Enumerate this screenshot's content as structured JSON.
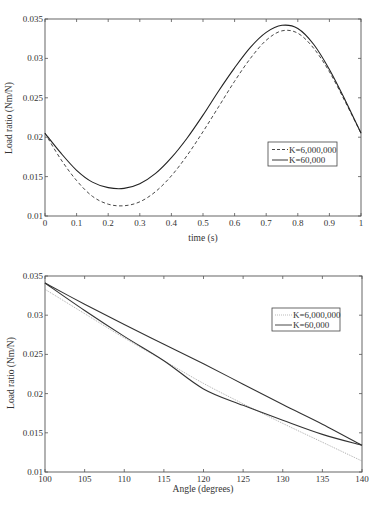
{
  "chart_data": [
    {
      "type": "line",
      "title": "",
      "xlabel": "time (s)",
      "ylabel": "Load ratio (Nm/N)",
      "xlim": [
        0,
        1
      ],
      "ylim": [
        0.01,
        0.035
      ],
      "grid": false,
      "legend_position": "inside right, lower-middle",
      "x_ticks": [
        "0",
        "0.1",
        "0.2",
        "0.3",
        "0.4",
        "0.5",
        "0.6",
        "0.7",
        "0.8",
        "0.9",
        "1"
      ],
      "y_ticks": [
        "0.01",
        "0.015",
        "0.02",
        "0.025",
        "0.03",
        "0.035"
      ],
      "x": [
        0,
        0.05,
        0.1,
        0.15,
        0.2,
        0.25,
        0.3,
        0.35,
        0.4,
        0.45,
        0.5,
        0.55,
        0.6,
        0.65,
        0.7,
        0.75,
        0.8,
        0.85,
        0.9,
        0.95,
        1.0
      ],
      "series": [
        {
          "name": "K=6,000,000",
          "style": "dashed",
          "color": "#333333",
          "values": [
            0.0205,
            0.0172,
            0.0145,
            0.0125,
            0.0115,
            0.0113,
            0.0118,
            0.0131,
            0.0151,
            0.0177,
            0.0207,
            0.0239,
            0.0271,
            0.03,
            0.0323,
            0.0335,
            0.0332,
            0.0313,
            0.0283,
            0.0245,
            0.0205
          ]
        },
        {
          "name": "K=60,000",
          "style": "solid",
          "color": "#222222",
          "values": [
            0.0205,
            0.018,
            0.0158,
            0.0143,
            0.0136,
            0.0135,
            0.0141,
            0.0154,
            0.0174,
            0.0199,
            0.0228,
            0.0259,
            0.0288,
            0.0314,
            0.0333,
            0.0342,
            0.0338,
            0.0318,
            0.0286,
            0.0247,
            0.0205
          ]
        }
      ]
    },
    {
      "type": "line",
      "title": "",
      "xlabel": "Angle (degrees)",
      "ylabel": "Load ratio (Nm/N)",
      "xlim": [
        100,
        140
      ],
      "ylim": [
        0.01,
        0.035
      ],
      "grid": false,
      "legend_position": "inside upper right",
      "x_ticks": [
        "100",
        "105",
        "110",
        "115",
        "120",
        "125",
        "130",
        "135",
        "140"
      ],
      "y_ticks": [
        "0.01",
        "0.015",
        "0.02",
        "0.025",
        "0.03",
        "0.035"
      ],
      "series": [
        {
          "name": "K=6,000,000",
          "style": "dotted-light",
          "color": "#999999",
          "x": [
            100,
            105,
            110,
            115,
            120,
            125,
            130,
            135,
            140
          ],
          "values": [
            0.0333,
            0.0302,
            0.0271,
            0.0242,
            0.0213,
            0.0187,
            0.0162,
            0.0138,
            0.0114
          ]
        },
        {
          "name": "K=60,000",
          "style": "solid",
          "color": "#333333",
          "branches": [
            {
              "label": "upper",
              "x": [
                100,
                105,
                110,
                115,
                120,
                125,
                130,
                135,
                140
              ],
              "values": [
                0.0341,
                0.0314,
                0.0288,
                0.0263,
                0.0238,
                0.0212,
                0.0186,
                0.0161,
                0.0134
              ]
            },
            {
              "label": "lower",
              "x": [
                100,
                105,
                110,
                115,
                120,
                125,
                130,
                135,
                140
              ],
              "values": [
                0.0341,
                0.0306,
                0.0273,
                0.0242,
                0.0206,
                0.0185,
                0.0166,
                0.0148,
                0.0134
              ]
            }
          ]
        }
      ]
    }
  ],
  "top": {
    "xlabel": "time (s)",
    "ylabel": "Load ratio (Nm/N)",
    "x_ticks": [
      "0",
      "0.1",
      "0.2",
      "0.3",
      "0.4",
      "0.5",
      "0.6",
      "0.7",
      "0.8",
      "0.9",
      "1"
    ],
    "y_ticks": [
      "0.01",
      "0.015",
      "0.02",
      "0.025",
      "0.03",
      "0.035"
    ],
    "legend": [
      "K=6,000,000",
      "K=60,000"
    ]
  },
  "bottom": {
    "xlabel": "Angle (degrees)",
    "ylabel": "Load ratio (Nm/N)",
    "x_ticks": [
      "100",
      "105",
      "110",
      "115",
      "120",
      "125",
      "130",
      "135",
      "140"
    ],
    "y_ticks": [
      "0.01",
      "0.015",
      "0.02",
      "0.025",
      "0.03",
      "0.035"
    ],
    "legend": [
      "K=6,000,000",
      "K=60,000"
    ]
  }
}
